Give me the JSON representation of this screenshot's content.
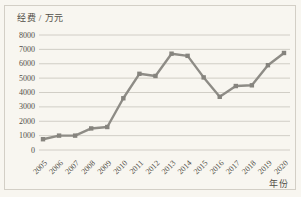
{
  "chart_data": {
    "type": "line",
    "title": "",
    "ylabel": "经费 / 万元",
    "xlabel": "年份",
    "categories": [
      "2005",
      "2006",
      "2007",
      "2008",
      "2009",
      "2010",
      "2011",
      "2012",
      "2013",
      "2014",
      "2015",
      "2016",
      "2017",
      "2018",
      "2019",
      "2020"
    ],
    "values": [
      750,
      1000,
      1000,
      1500,
      1600,
      3600,
      5300,
      5150,
      6700,
      6550,
      5050,
      3700,
      4450,
      4500,
      5900,
      6750
    ],
    "ylim": [
      0,
      8000
    ],
    "ytick_step": 1000,
    "yticks": [
      0,
      1000,
      2000,
      3000,
      4000,
      5000,
      6000,
      7000,
      8000
    ],
    "grid": "horizontal",
    "legend": "none",
    "marker": "square",
    "x_tick_rotation": 45,
    "colors": {
      "line": "#8e8c86",
      "marker": "#86847e",
      "grid": "#c7c4bb",
      "text": "#514e47",
      "background": "#f8f6f0",
      "frame": "#d3cfc6"
    }
  }
}
